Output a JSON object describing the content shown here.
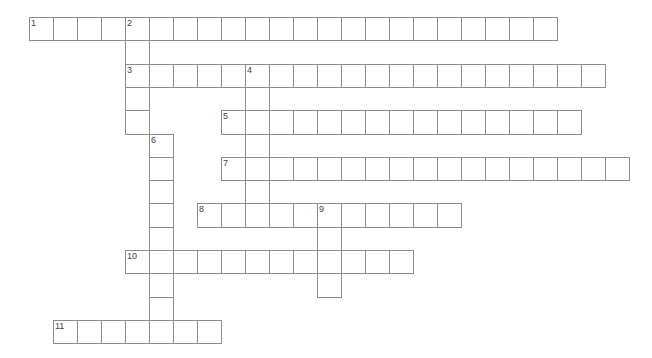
{
  "puzzle": {
    "type": "crossword",
    "grid": {
      "origin_x": 29,
      "origin_y": 17,
      "cell_width": 24,
      "cell_height": 23.3,
      "line_color": "#8c8c8c"
    },
    "entries": [
      {
        "number": "1",
        "direction": "across",
        "row": 0,
        "col": 0,
        "length": 22
      },
      {
        "number": "2",
        "direction": "down",
        "row": 0,
        "col": 4,
        "length": 5
      },
      {
        "number": "3",
        "direction": "across",
        "row": 2,
        "col": 4,
        "length": 20
      },
      {
        "number": "4",
        "direction": "down",
        "row": 2,
        "col": 9,
        "length": 7
      },
      {
        "number": "5",
        "direction": "across",
        "row": 4,
        "col": 8,
        "length": 15
      },
      {
        "number": "6",
        "direction": "down",
        "row": 5,
        "col": 5,
        "length": 9
      },
      {
        "number": "7",
        "direction": "across",
        "row": 6,
        "col": 8,
        "length": 17
      },
      {
        "number": "8",
        "direction": "across",
        "row": 8,
        "col": 7,
        "length": 11
      },
      {
        "number": "9",
        "direction": "down",
        "row": 8,
        "col": 12,
        "length": 4
      },
      {
        "number": "10",
        "direction": "across",
        "row": 10,
        "col": 4,
        "length": 12
      },
      {
        "number": "11",
        "direction": "across",
        "row": 13,
        "col": 1,
        "length": 7
      }
    ]
  }
}
